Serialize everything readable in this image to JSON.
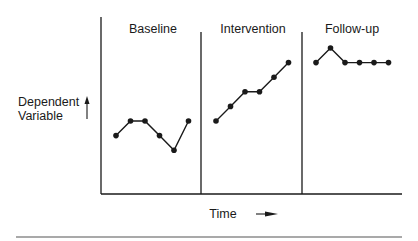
{
  "chart_data": {
    "type": "line",
    "title": "",
    "xlabel": "Time",
    "ylabel": "Dependent Variable",
    "grid": false,
    "legend": null,
    "phases": [
      {
        "name": "Baseline",
        "values": [
          3,
          4,
          4,
          3,
          2,
          4
        ]
      },
      {
        "name": "Intervention",
        "values": [
          4,
          5,
          6,
          6,
          7,
          8
        ]
      },
      {
        "name": "Follow-up",
        "values": [
          8,
          9,
          8,
          8,
          8,
          8
        ]
      }
    ],
    "ylim": [
      0,
      11
    ]
  },
  "labels": {
    "phase_baseline": "Baseline",
    "phase_intervention": "Intervention",
    "phase_followup": "Follow-up",
    "y_line1": "Dependent",
    "y_line2": "Variable",
    "x_label": "Time"
  },
  "colors": {
    "ink": "#1a1a1a",
    "background": "#ffffff"
  }
}
